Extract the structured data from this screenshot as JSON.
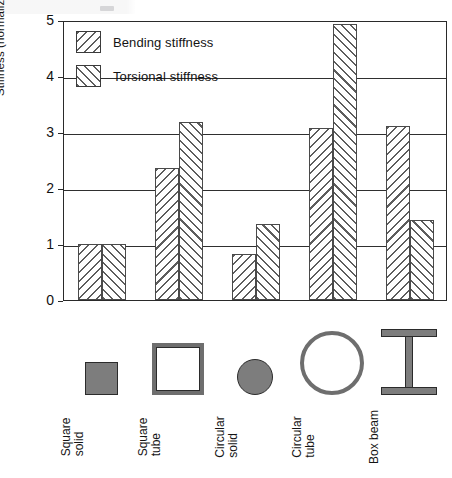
{
  "chart_data": {
    "type": "bar",
    "title": "",
    "xlabel": "",
    "ylabel": "Stiffness (normalized to square solid)",
    "ylim": [
      0,
      5
    ],
    "yticks": [
      "0",
      "1",
      "2",
      "3",
      "4",
      "5"
    ],
    "grid": true,
    "legend_position": "top-left",
    "categories": [
      "Square solid",
      "Square tube",
      "Circular solid",
      "Circular tube",
      "Box beam"
    ],
    "category_lines": [
      [
        "Square",
        "solid"
      ],
      [
        "Square",
        "tube"
      ],
      [
        "Circular",
        "solid"
      ],
      [
        "Circular",
        "tube"
      ],
      [
        "Box beam"
      ]
    ],
    "series": [
      {
        "name": "Bending stiffness",
        "hatch": "backslash",
        "values": [
          1.0,
          2.35,
          0.83,
          3.08,
          3.11
        ]
      },
      {
        "name": "Torsional stiffness",
        "hatch": "forwardslash",
        "values": [
          1.0,
          3.18,
          1.36,
          4.93,
          1.43
        ]
      }
    ],
    "cross_section_icons": [
      "square-solid-icon",
      "square-tube-icon",
      "circular-solid-icon",
      "circular-tube-icon",
      "box-beam-icon"
    ]
  },
  "legend": {
    "items": [
      {
        "label": "Bending stiffness",
        "swatch": "hatch-backslash-swatch"
      },
      {
        "label": "Torsional stiffness",
        "swatch": "hatch-forwardslash-swatch"
      }
    ]
  },
  "colors": {
    "axis": "#2a2a2a",
    "gridline": "#2f2f2f",
    "hatch": "#5d5d5d",
    "icon_fill": "#7d7d7d",
    "background": "#ffffff"
  }
}
